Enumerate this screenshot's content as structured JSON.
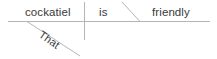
{
  "diagram": {
    "type": "reed-kellogg-sentence-diagram",
    "sentence": "That cockatiel is friendly",
    "canvas": {
      "width": 217,
      "height": 59,
      "background": "#ffffff"
    },
    "line_color": "#b5b5b5",
    "text_color": "#3a3a3a",
    "words": {
      "subject": "cockatiel",
      "verb": "is",
      "complement": "friendly",
      "modifier": "That"
    },
    "lines": {
      "baseline": {
        "name": "main-baseline",
        "x1": 8,
        "y1": 21.5,
        "x2": 210,
        "y2": 21.5
      },
      "subject_verb_divider": {
        "name": "subject-verb-divider",
        "x1": 84.5,
        "y1": 2,
        "x2": 84.5,
        "y2": 40
      },
      "complement_divider": {
        "name": "predicate-complement-divider",
        "x1": 122,
        "y1": 2,
        "x2": 140,
        "y2": 21.5
      },
      "modifier_slant": {
        "name": "modifier-slant-line",
        "x1": 27,
        "y1": 21.5,
        "x2": 80,
        "y2": 56
      }
    }
  }
}
